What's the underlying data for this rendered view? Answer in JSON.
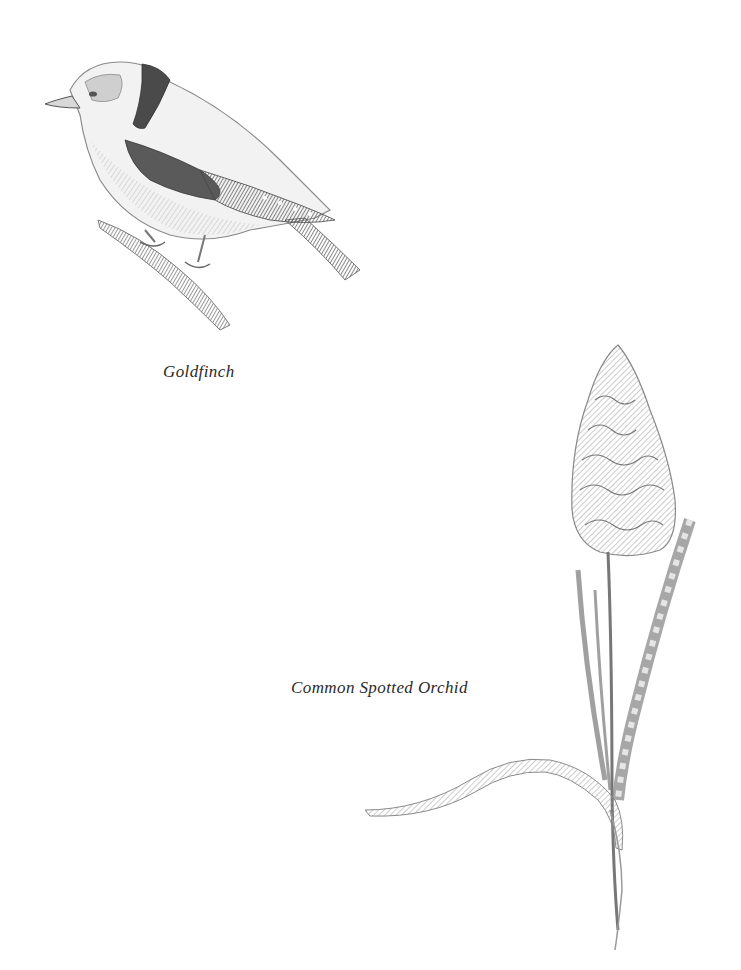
{
  "page": {
    "background": "#ffffff",
    "ink_color": "#555555"
  },
  "figures": [
    {
      "subject": "goldfinch",
      "caption": "Goldfinch",
      "style": "pencil sketch"
    },
    {
      "subject": "common-spotted-orchid",
      "caption": "Common Spotted Orchid",
      "style": "pencil sketch"
    }
  ]
}
